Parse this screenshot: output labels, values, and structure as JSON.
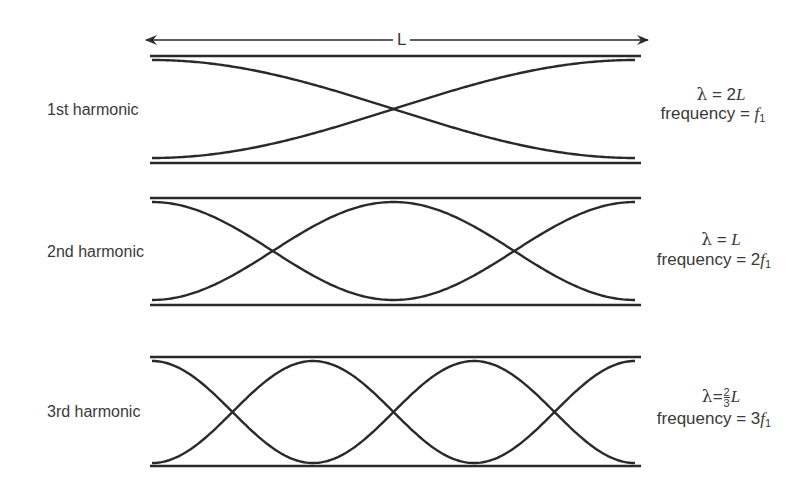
{
  "figure": {
    "length_label": "L",
    "harmonics": [
      {
        "label": "1st harmonic",
        "lambda_symbol": "λ",
        "wavelength_value": "2",
        "wavelength_unit": "L",
        "frequency_prefix": "frequency = ",
        "frequency_coef": "",
        "frequency_var": "f",
        "frequency_sub": "1",
        "half_wavelengths": 1
      },
      {
        "label": "2nd harmonic",
        "lambda_symbol": "λ",
        "wavelength_value": "",
        "wavelength_unit": "L",
        "frequency_prefix": "frequency = ",
        "frequency_coef": "2",
        "frequency_var": "f",
        "frequency_sub": "1",
        "half_wavelengths": 2
      },
      {
        "label": "3rd harmonic",
        "lambda_symbol": "λ",
        "wavelength_frac_num": "2",
        "wavelength_frac_den": "3",
        "wavelength_unit": "L",
        "frequency_prefix": "frequency = ",
        "frequency_coef": "3",
        "frequency_var": "f",
        "frequency_sub": "1",
        "half_wavelengths": 3
      }
    ],
    "colors": {
      "line": "#2a2a2a",
      "text": "#3a3a3a"
    }
  }
}
